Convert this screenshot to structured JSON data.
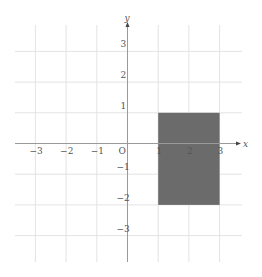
{
  "diagram": {
    "type": "coordinate-grid",
    "x_axis": {
      "label": "x",
      "min": -3,
      "max": 3,
      "ticks": [
        {
          "value": -3,
          "label": "−3"
        },
        {
          "value": -2,
          "label": "−2"
        },
        {
          "value": -1,
          "label": "−1"
        },
        {
          "value": 1,
          "label": "1"
        },
        {
          "value": 2,
          "label": "2"
        },
        {
          "value": 3,
          "label": "3"
        }
      ]
    },
    "y_axis": {
      "label": "y",
      "min": -3,
      "max": 3,
      "ticks": [
        {
          "value": 3,
          "label": "3"
        },
        {
          "value": 2,
          "label": "2"
        },
        {
          "value": 1,
          "label": "1"
        },
        {
          "value": -1,
          "label": "−1"
        },
        {
          "value": -2,
          "label": "−2"
        },
        {
          "value": -3,
          "label": "−3"
        }
      ]
    },
    "origin_label": "O",
    "shaded_rectangle": {
      "x_min": 1,
      "x_max": 3,
      "y_min": -2,
      "y_max": 1,
      "color": "#6b6b6b"
    },
    "colors": {
      "grid": "#e3e3e3",
      "axis": "#9a9a9a",
      "text": "#555555"
    }
  }
}
